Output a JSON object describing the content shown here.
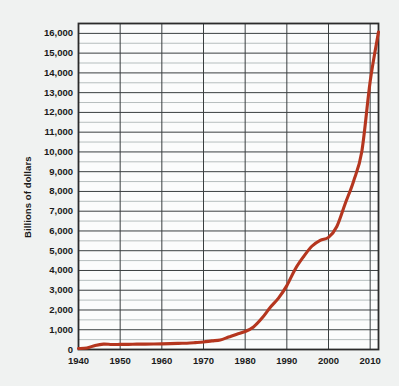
{
  "chart_data": {
    "type": "line",
    "title": "",
    "subtitle": "",
    "xlabel": "",
    "ylabel": "Billions of dollars",
    "xlim": [
      1940,
      2012
    ],
    "ylim": [
      0,
      16500
    ],
    "grid": true,
    "legend": false,
    "legend_position": "none",
    "line_color": "#b5361f",
    "y_ticks": [
      0,
      1000,
      2000,
      3000,
      4000,
      5000,
      6000,
      7000,
      8000,
      9000,
      10000,
      11000,
      12000,
      13000,
      14000,
      15000,
      16000
    ],
    "y_tick_labels": [
      "0",
      "1,000",
      "2,000",
      "3,000",
      "4,000",
      "5,000",
      "6,000",
      "7,000",
      "8,000",
      "9,000",
      "10,000",
      "11,000",
      "12,000",
      "13,000",
      "14,000",
      "15,000",
      "16,000"
    ],
    "y_minor_step": 500,
    "x_ticks": [
      1940,
      1950,
      1960,
      1970,
      1980,
      1990,
      2000,
      2010
    ],
    "x_tick_labels": [
      "1940",
      "1950",
      "1960",
      "1970",
      "1980",
      "1990",
      "2000",
      "2010"
    ],
    "x": [
      1940,
      1942,
      1944,
      1946,
      1948,
      1950,
      1952,
      1954,
      1956,
      1958,
      1960,
      1962,
      1964,
      1966,
      1968,
      1970,
      1972,
      1974,
      1976,
      1978,
      1980,
      1982,
      1984,
      1986,
      1988,
      1990,
      1992,
      1994,
      1996,
      1998,
      2000,
      2002,
      2004,
      2006,
      2008,
      2010,
      2012
    ],
    "y": [
      51,
      79,
      204,
      271,
      252,
      257,
      259,
      271,
      272,
      276,
      286,
      298,
      312,
      320,
      348,
      381,
      436,
      484,
      629,
      776,
      909,
      1142,
      1577,
      2125,
      2602,
      3233,
      4065,
      4693,
      5225,
      5526,
      5674,
      6228,
      7379,
      8507,
      10025,
      13562,
      16066
    ],
    "series": [
      {
        "name": "U.S. national debt",
        "values": [
          51,
          79,
          204,
          271,
          252,
          257,
          259,
          271,
          272,
          276,
          286,
          298,
          312,
          320,
          348,
          381,
          436,
          484,
          629,
          776,
          909,
          1142,
          1577,
          2125,
          2602,
          3233,
          4065,
          4693,
          5225,
          5526,
          5674,
          6228,
          7379,
          8507,
          10025,
          13562,
          16066
        ]
      }
    ]
  }
}
